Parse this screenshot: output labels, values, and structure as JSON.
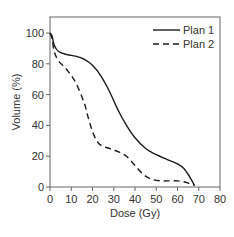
{
  "chart_data": {
    "type": "line",
    "title": "",
    "xlabel": "Dose (Gy)",
    "ylabel": "Volume (%)",
    "xlim": [
      0,
      80
    ],
    "ylim": [
      0,
      100
    ],
    "xticks": [
      0,
      10,
      20,
      30,
      40,
      50,
      60,
      70,
      80
    ],
    "yticks": [
      0,
      20,
      40,
      60,
      80,
      100
    ],
    "grid": false,
    "legend_position": "upper right",
    "series": [
      {
        "name": "Plan 1",
        "style": "solid",
        "x": [
          0,
          1,
          2,
          4,
          8,
          12,
          16,
          20,
          24,
          28,
          32,
          36,
          40,
          45,
          50,
          55,
          60,
          63,
          66,
          68
        ],
        "y": [
          100,
          98,
          92,
          88,
          86,
          85,
          83,
          79,
          72,
          62,
          50,
          40,
          32,
          25,
          21,
          18,
          15,
          12,
          6,
          1
        ]
      },
      {
        "name": "Plan 2",
        "style": "dashed",
        "x": [
          0,
          1,
          2,
          4,
          8,
          12,
          16,
          18,
          20,
          22,
          24,
          28,
          32,
          36,
          40,
          44,
          48,
          52,
          56,
          60,
          64,
          68
        ],
        "y": [
          100,
          96,
          88,
          82,
          76,
          68,
          55,
          45,
          36,
          30,
          27,
          25,
          23,
          20,
          14,
          8,
          5,
          4,
          4,
          4,
          3,
          1
        ]
      }
    ]
  },
  "axes": {
    "xlabel": "Dose (Gy)",
    "ylabel": "Volume (%)",
    "xtick_labels": [
      "0",
      "10",
      "20",
      "30",
      "40",
      "50",
      "60",
      "70",
      "80"
    ],
    "ytick_labels": [
      "0",
      "20",
      "40",
      "60",
      "80",
      "100"
    ]
  },
  "legend": {
    "items": [
      {
        "label": "Plan 1",
        "style": "solid"
      },
      {
        "label": "Plan 2",
        "style": "dashed"
      }
    ]
  },
  "colors": {
    "line": "#1a1a1a",
    "axis": "#555555",
    "text": "#333333"
  }
}
